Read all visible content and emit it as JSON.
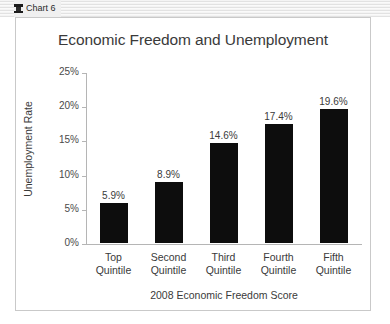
{
  "window": {
    "title": "Chart 6",
    "icon": "pushpin-icon"
  },
  "chart_data": {
    "type": "bar",
    "title": "Economic Freedom and Unemployment",
    "xlabel": "2008 Economic Freedom Score",
    "ylabel": "Unemployment Rate",
    "categories": [
      "Top Quintile",
      "Second Quintile",
      "Third Quintile",
      "Fourth Quintile",
      "Fifth Quintile"
    ],
    "category_lines": [
      [
        "Top",
        "Quintile"
      ],
      [
        "Second",
        "Quintile"
      ],
      [
        "Third",
        "Quintile"
      ],
      [
        "Fourth",
        "Quintile"
      ],
      [
        "Fifth",
        "Quintile"
      ]
    ],
    "values": [
      5.9,
      8.9,
      14.6,
      17.4,
      19.6
    ],
    "value_labels": [
      "5.9%",
      "8.9%",
      "14.6%",
      "17.4%",
      "19.6%"
    ],
    "ylim": [
      0,
      25
    ],
    "ytick_values": [
      0,
      5,
      10,
      15,
      20,
      25
    ],
    "ytick_labels": [
      "0%",
      "5%",
      "10%",
      "15%",
      "20%",
      "25%"
    ],
    "grid": false,
    "legend": false,
    "bar_color": "#0d0d0d",
    "axis_color": "#b5b5b5",
    "text_color": "#3a3a3a"
  }
}
